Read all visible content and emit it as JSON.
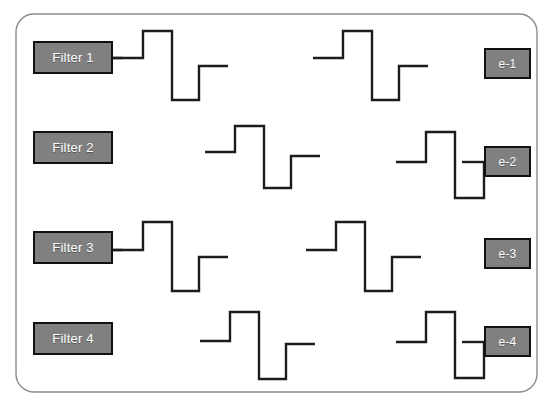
{
  "diagram": {
    "type": "signal-flow-block-diagram",
    "background_color": "#ffffff",
    "frame": {
      "name": "outer-rounded-frame",
      "x": 16,
      "y": 14,
      "width": 521,
      "height": 378,
      "corner_radius": 18,
      "stroke_color": "#8c8c8c",
      "stroke_width": 1.4,
      "fill": "none"
    },
    "style": {
      "box_fill": "#808080",
      "box_border": "#111111",
      "box_text_color": "#ffffff",
      "wave_stroke": "#1c1c1c",
      "wave_stroke_width": 2.4
    },
    "filter_boxes": [
      {
        "name": "filter-1",
        "label": "Filter 1",
        "x": 33,
        "y": 41,
        "width": 80,
        "height": 33
      },
      {
        "name": "filter-2",
        "label": "Filter 2",
        "x": 33,
        "y": 131,
        "width": 80,
        "height": 33
      },
      {
        "name": "filter-3",
        "label": "Filter 3",
        "x": 33,
        "y": 231,
        "width": 80,
        "height": 33
      },
      {
        "name": "filter-4",
        "label": "Filter 4",
        "x": 33,
        "y": 322,
        "width": 80,
        "height": 33
      }
    ],
    "output_boxes": [
      {
        "name": "output-e-1",
        "label": "e-1",
        "x": 484,
        "y": 48,
        "width": 47,
        "height": 31
      },
      {
        "name": "output-e-2",
        "label": "e-2",
        "x": 484,
        "y": 146,
        "width": 47,
        "height": 31
      },
      {
        "name": "output-e-3",
        "label": "e-3",
        "x": 484,
        "y": 238,
        "width": 47,
        "height": 31
      },
      {
        "name": "output-e-4",
        "label": "e-4",
        "x": 484,
        "y": 326,
        "width": 47,
        "height": 31
      }
    ],
    "waveforms": [
      {
        "name": "waveform-row1-left",
        "row": 1,
        "points": "113,58 143,58 143,31 172,31 172,100 199,100 199,66 228,66"
      },
      {
        "name": "waveform-row1-right",
        "row": 1,
        "points": "313,58 343,58 343,31 372,31 372,100 399,100 399,66 428,66"
      },
      {
        "name": "waveform-row2-left",
        "row": 2,
        "points": "205,152 235,152 235,126 264,126 264,188 291,188 291,156 320,156"
      },
      {
        "name": "waveform-row2-right",
        "row": 2,
        "points": "396,162 426,162 426,132 455,132 455,198 484,198 484,162 484,162"
      },
      {
        "name": "waveform-row3-left",
        "row": 3,
        "points": "113,250 143,250 143,222 172,222 172,291 199,291 199,257 228,257"
      },
      {
        "name": "waveform-row3-right",
        "row": 3,
        "points": "306,250 336,250 336,222 365,222 365,291 392,291 392,257 421,257"
      },
      {
        "name": "waveform-row4-left",
        "row": 4,
        "points": "200,341 230,341 230,312 259,312 259,379 286,379 286,344 315,344"
      },
      {
        "name": "waveform-row4-right",
        "row": 4,
        "points": "396,342 426,342 426,312 455,312 455,378 484,378 484,342 484,342"
      }
    ],
    "connectors": [
      {
        "name": "connector-filter1-to-wave",
        "points": "113,58 123,58"
      },
      {
        "name": "connector-filter3-to-wave",
        "points": "113,250 123,250"
      },
      {
        "name": "connector-wave-to-e2",
        "points": "462,162 484,162"
      },
      {
        "name": "connector-wave-to-e4",
        "points": "462,342 484,342"
      }
    ]
  }
}
